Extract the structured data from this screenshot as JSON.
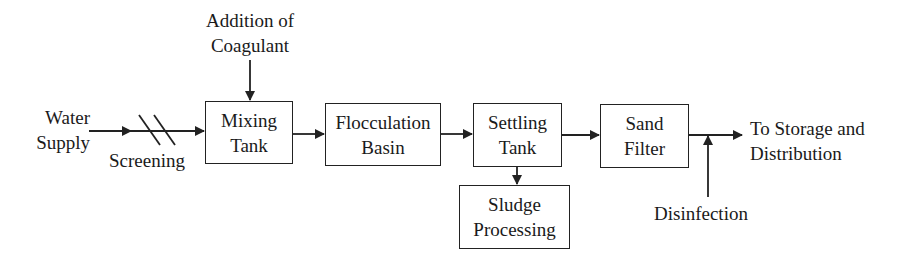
{
  "diagram": {
    "type": "process-flow",
    "title": "",
    "colors": {
      "stroke": "#222222",
      "text": "#1a1a1a",
      "background": "#ffffff"
    },
    "inputs": {
      "water_supply": [
        "Water",
        "Supply"
      ],
      "coagulant": [
        "Addition of",
        "Coagulant"
      ],
      "disinfection": "Disinfection"
    },
    "screening": "Screening",
    "boxes": {
      "mixing": [
        "Mixing",
        "Tank"
      ],
      "flocculation": [
        "Flocculation",
        "Basin"
      ],
      "settling": [
        "Settling",
        "Tank"
      ],
      "sludge": [
        "Sludge",
        "Processing"
      ],
      "sand_filter": [
        "Sand",
        "Filter"
      ]
    },
    "output": [
      "To Storage and",
      "Distribution"
    ],
    "edges": [
      {
        "from": "Water Supply",
        "to": "Screening"
      },
      {
        "from": "Screening",
        "to": "Mixing Tank"
      },
      {
        "from": "Addition of Coagulant",
        "to": "Mixing Tank"
      },
      {
        "from": "Mixing Tank",
        "to": "Flocculation Basin"
      },
      {
        "from": "Flocculation Basin",
        "to": "Settling Tank"
      },
      {
        "from": "Settling Tank",
        "to": "Sludge Processing"
      },
      {
        "from": "Settling Tank",
        "to": "Sand Filter"
      },
      {
        "from": "Sand Filter",
        "to": "To Storage and Distribution"
      },
      {
        "from": "Disinfection",
        "to": "Sand Filter outlet line"
      }
    ]
  }
}
